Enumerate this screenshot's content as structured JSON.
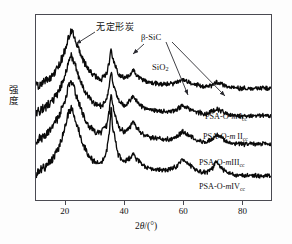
{
  "axes": {
    "y_label": "强度",
    "x_label_prefix": "2",
    "x_label_theta": "θ",
    "x_label_unit": "/(°)",
    "x_ticks": [
      "20",
      "40",
      "60",
      "80"
    ],
    "x_tick_values": [
      20,
      40,
      60,
      80
    ],
    "xlim": [
      10,
      90
    ]
  },
  "annotations": [
    {
      "name": "amorphous-carbon",
      "text": "无定形炭",
      "cjk": true
    },
    {
      "name": "beta-sic",
      "text": "β-SiC",
      "cjk": false
    },
    {
      "name": "silica",
      "text": "SiO",
      "sub": "2",
      "cjk": false
    }
  ],
  "curve_labels": [
    {
      "base": "PSA-O-",
      "italic": "m",
      "roman": " I",
      "sub": "cc"
    },
    {
      "base": "PSA-O-",
      "italic": "m",
      "roman": " II",
      "sub": "cc"
    },
    {
      "base": "PSA-O-",
      "italic": "m",
      "roman": "III",
      "sub": "cc"
    },
    {
      "base": "PSA-O-",
      "italic": "m",
      "roman": "IV",
      "sub": "cc"
    }
  ],
  "colors": {
    "curve": "#0a0a0a",
    "frame": "#4a4a52",
    "arrow": "#2a2a30",
    "background": "#ffffff"
  },
  "chart_data": {
    "type": "line",
    "title": "",
    "xlabel": "2θ/(°)",
    "ylabel": "强度",
    "xlim": [
      10,
      90
    ],
    "ylim": [
      0,
      1
    ],
    "grid": false,
    "legend": "inline-right",
    "peaks": [
      {
        "two_theta": 22.0,
        "assignment": "无定形炭",
        "label": "amorphous carbon",
        "relative_height": 1.0
      },
      {
        "two_theta": 35.6,
        "assignment": "β-SiC",
        "label": "beta-SiC (111)",
        "relative_height": 0.95
      },
      {
        "two_theta": 43.0,
        "assignment": "SiO2",
        "label": "silica",
        "relative_height": 0.35
      },
      {
        "two_theta": 60.0,
        "assignment": "β-SiC",
        "label": "beta-SiC (220)",
        "relative_height": 0.25
      },
      {
        "two_theta": 71.5,
        "assignment": "β-SiC",
        "label": "beta-SiC (311)",
        "relative_height": 0.2
      }
    ],
    "series": [
      {
        "name": "PSA-O-mIcc",
        "offset_index": 0,
        "x": [
          10,
          12,
          14,
          16,
          18,
          20,
          21,
          22,
          23,
          24,
          26,
          28,
          30,
          32,
          34,
          35,
          35.6,
          36,
          38,
          40,
          42,
          43,
          44,
          46,
          48,
          50,
          52,
          54,
          56,
          58,
          60,
          62,
          64,
          66,
          68,
          70,
          71.5,
          73,
          75,
          77,
          79,
          80
        ],
        "y": [
          0.16,
          0.2,
          0.26,
          0.34,
          0.48,
          0.72,
          0.88,
          1.0,
          0.93,
          0.78,
          0.55,
          0.4,
          0.3,
          0.26,
          0.34,
          0.52,
          0.74,
          0.6,
          0.34,
          0.28,
          0.33,
          0.4,
          0.34,
          0.26,
          0.22,
          0.2,
          0.19,
          0.18,
          0.18,
          0.2,
          0.26,
          0.22,
          0.18,
          0.16,
          0.15,
          0.17,
          0.21,
          0.18,
          0.15,
          0.13,
          0.12,
          0.12
        ]
      },
      {
        "name": "PSA-O-mIIcc",
        "offset_index": 1,
        "x": [
          10,
          12,
          14,
          16,
          18,
          20,
          21,
          22,
          23,
          24,
          26,
          28,
          30,
          32,
          34,
          35,
          35.6,
          36,
          38,
          40,
          42,
          43,
          44,
          46,
          48,
          50,
          52,
          54,
          56,
          58,
          60,
          62,
          64,
          66,
          68,
          70,
          71.5,
          73,
          75,
          77,
          79,
          80
        ],
        "y": [
          0.16,
          0.21,
          0.27,
          0.36,
          0.5,
          0.74,
          0.9,
          1.0,
          0.92,
          0.77,
          0.54,
          0.39,
          0.29,
          0.26,
          0.36,
          0.56,
          0.8,
          0.64,
          0.35,
          0.28,
          0.34,
          0.42,
          0.35,
          0.26,
          0.22,
          0.2,
          0.19,
          0.18,
          0.18,
          0.21,
          0.28,
          0.23,
          0.18,
          0.16,
          0.15,
          0.18,
          0.23,
          0.19,
          0.15,
          0.13,
          0.12,
          0.12
        ]
      },
      {
        "name": "PSA-O-mIIIcc",
        "offset_index": 2,
        "x": [
          10,
          12,
          14,
          16,
          18,
          20,
          21,
          22,
          23,
          24,
          26,
          28,
          30,
          32,
          34,
          35,
          35.6,
          36,
          38,
          40,
          42,
          43,
          44,
          46,
          48,
          50,
          52,
          54,
          56,
          58,
          60,
          62,
          64,
          66,
          68,
          70,
          71.5,
          73,
          75,
          77,
          79,
          80
        ],
        "y": [
          0.16,
          0.21,
          0.28,
          0.37,
          0.52,
          0.76,
          0.92,
          1.0,
          0.91,
          0.76,
          0.53,
          0.38,
          0.29,
          0.27,
          0.38,
          0.6,
          0.86,
          0.68,
          0.36,
          0.29,
          0.35,
          0.44,
          0.36,
          0.27,
          0.22,
          0.2,
          0.19,
          0.18,
          0.19,
          0.22,
          0.3,
          0.24,
          0.19,
          0.16,
          0.15,
          0.19,
          0.25,
          0.2,
          0.16,
          0.13,
          0.12,
          0.12
        ]
      },
      {
        "name": "PSA-O-mIVcc",
        "offset_index": 3,
        "x": [
          10,
          12,
          14,
          16,
          18,
          20,
          21,
          22,
          23,
          24,
          26,
          28,
          30,
          32,
          34,
          35,
          35.6,
          36,
          38,
          40,
          42,
          43,
          44,
          46,
          48,
          50,
          52,
          54,
          56,
          58,
          60,
          62,
          64,
          66,
          68,
          70,
          71.5,
          73,
          75,
          77,
          79,
          80
        ],
        "y": [
          0.15,
          0.2,
          0.27,
          0.36,
          0.5,
          0.74,
          0.9,
          0.98,
          0.9,
          0.75,
          0.52,
          0.37,
          0.28,
          0.28,
          0.42,
          0.68,
          1.0,
          0.76,
          0.38,
          0.3,
          0.34,
          0.4,
          0.34,
          0.26,
          0.22,
          0.2,
          0.2,
          0.19,
          0.2,
          0.24,
          0.34,
          0.26,
          0.2,
          0.17,
          0.16,
          0.21,
          0.3,
          0.22,
          0.16,
          0.13,
          0.12,
          0.12
        ]
      }
    ],
    "arrows": [
      {
        "from": "无定形炭",
        "to_two_theta": 22.0
      },
      {
        "from": "β-SiC",
        "to_two_theta": 35.6
      },
      {
        "from": "β-SiC",
        "to_two_theta": 60.0
      },
      {
        "from": "β-SiC",
        "to_two_theta": 71.5
      }
    ]
  }
}
